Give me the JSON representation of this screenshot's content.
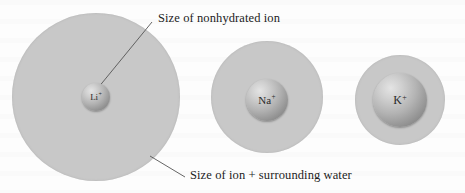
{
  "figure": {
    "background_color": "#fdfdfd",
    "halo_color": "#c8c8c8",
    "ion_color_light": "#e4e4e4",
    "ion_color_dark": "#6f6f6f",
    "leader_line_color": "#555555",
    "text_color": "#1c1c1c"
  },
  "annotations": {
    "nonhydrated_label": "Size of nonhydrated ion",
    "hydrated_label": "Size of ion + surrounding water"
  },
  "ions": [
    {
      "name": "lithium-ion",
      "symbol": "Li",
      "charge": "+",
      "halo_cx": 96,
      "halo_cy": 97,
      "halo_r": 84,
      "ion_cx": 96,
      "ion_cy": 97,
      "ion_r": 14
    },
    {
      "name": "sodium-ion",
      "symbol": "Na",
      "charge": "+",
      "halo_cx": 267,
      "halo_cy": 97,
      "halo_r": 56,
      "ion_cx": 267,
      "ion_cy": 100,
      "ion_r": 21
    },
    {
      "name": "potassium-ion",
      "symbol": "K",
      "charge": "+",
      "halo_cx": 400,
      "halo_cy": 100,
      "halo_r": 45,
      "ion_cx": 400,
      "ion_cy": 100,
      "ion_r": 27
    }
  ],
  "leaders": [
    {
      "name": "nonhydrated-leader",
      "x1": 152,
      "y1": 22,
      "x2": 93,
      "y2": 94
    },
    {
      "name": "hydrated-leader",
      "x1": 185,
      "y1": 177,
      "x2": 150,
      "y2": 156
    }
  ],
  "label_positions": {
    "nonhydrated": {
      "x": 158,
      "y": 11
    },
    "hydrated": {
      "x": 190,
      "y": 168
    }
  }
}
